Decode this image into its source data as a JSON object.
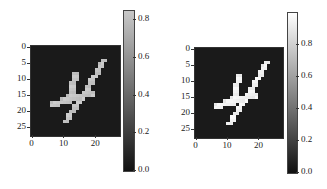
{
  "chart_data": [
    {
      "type": "heatmap",
      "title": "",
      "xlabel": "",
      "ylabel": "",
      "x_ticks": [
        "0",
        "10",
        "20"
      ],
      "y_ticks": [
        "0",
        "5",
        "10",
        "15",
        "20",
        "25"
      ],
      "grid_size": [
        28,
        28
      ],
      "colormap": "gray",
      "max_value": 0.85,
      "colorbar": {
        "ticks": [
          "0.0",
          "0.2",
          "0.4",
          "0.6",
          "0.8"
        ],
        "range": [
          0.0,
          0.85
        ]
      },
      "description": "Handwritten digit 4, lighter stroke intensity (~0.8)"
    },
    {
      "type": "heatmap",
      "title": "",
      "xlabel": "",
      "ylabel": "",
      "x_ticks": [
        "0",
        "10",
        "20"
      ],
      "y_ticks": [
        "0",
        "5",
        "10",
        "15",
        "20",
        "25"
      ],
      "grid_size": [
        28,
        28
      ],
      "colormap": "gray",
      "max_value": 1.0,
      "colorbar": {
        "ticks": [
          "0.0",
          "0.2",
          "0.4",
          "0.6",
          "0.8"
        ],
        "range": [
          0.0,
          1.0
        ]
      },
      "description": "Handwritten digit 4, bright stroke intensity (~1.0)"
    }
  ],
  "labels": {
    "x": [
      "0",
      "10",
      "20"
    ],
    "y": [
      "0",
      "5",
      "10",
      "15",
      "20",
      "25"
    ],
    "cb": [
      "0.8",
      "0.6",
      "0.4",
      "0.2",
      "0.0"
    ]
  }
}
